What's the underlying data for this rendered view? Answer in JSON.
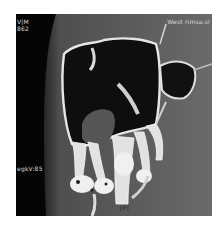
{
  "image": {
    "description": "Coronal CT / CBCT slice of maxillary sinus and upper teeth",
    "background": "#ffffff",
    "frame_color": "#5a5a5a"
  },
  "overlays": {
    "top_left_line1": "V|M",
    "top_left_line2": "862",
    "top_right": "West rimsa.sl",
    "mid_left": "egkV:85",
    "bottom_center": "[P]"
  }
}
